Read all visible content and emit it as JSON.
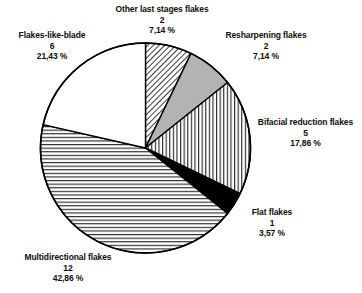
{
  "chart_data": {
    "type": "pie",
    "title": "",
    "subtitle": "",
    "xlabel": "",
    "ylabel": "",
    "legend_position": "none",
    "grid": false,
    "total_count": 28,
    "start_angle_deg": 0,
    "direction": "clockwise",
    "categories": [
      "Other last stages flakes",
      "Resharpening flakes",
      "Bifacial reduction flakes",
      "Flat flakes",
      "Multidirectional flakes",
      "Flakes-like-blade"
    ],
    "values": [
      2,
      2,
      5,
      1,
      12,
      6
    ],
    "percent_labels": [
      "7,14 %",
      "7,14 %",
      "17,86 %",
      "3,57 %",
      "42,86 %",
      "21,43 %"
    ],
    "percents": [
      7.14,
      7.14,
      17.86,
      3.57,
      42.86,
      21.43
    ],
    "slices": [
      {
        "name": "Other last stages flakes",
        "count": "2",
        "percent": "7,14 %",
        "percent_value": 7.14,
        "fill": "diagonal-hatch",
        "fill_color": "#ffffff",
        "line_color": "#000000"
      },
      {
        "name": "Resharpening flakes",
        "count": "2",
        "percent": "7,14 %",
        "percent_value": 7.14,
        "fill": "solid-gray",
        "fill_color": "#b3b3b3",
        "line_color": "#000000"
      },
      {
        "name": "Bifacial reduction flakes",
        "count": "5",
        "percent": "17,86 %",
        "percent_value": 17.86,
        "fill": "vertical-hatch",
        "fill_color": "#ffffff",
        "line_color": "#000000"
      },
      {
        "name": "Flat flakes",
        "count": "1",
        "percent": "3,57 %",
        "percent_value": 3.57,
        "fill": "solid-black",
        "fill_color": "#000000",
        "line_color": "#000000"
      },
      {
        "name": "Multidirectional flakes",
        "count": "12",
        "percent": "42,86 %",
        "percent_value": 42.86,
        "fill": "horizontal-hatch",
        "fill_color": "#ffffff",
        "line_color": "#000000"
      },
      {
        "name": "Flakes-like-blade",
        "count": "6",
        "percent": "21,43 %",
        "percent_value": 21.43,
        "fill": "white",
        "fill_color": "#ffffff",
        "line_color": "#000000"
      }
    ]
  },
  "labels": {
    "other": {
      "name": "Other last stages flakes",
      "count": "2",
      "percent": "7,14 %"
    },
    "resharpening": {
      "name": "Resharpening flakes",
      "count": "2",
      "percent": "7,14 %"
    },
    "bifacial": {
      "name": "Bifacial reduction flakes",
      "count": "5",
      "percent": "17,86 %"
    },
    "flat": {
      "name": "Flat flakes",
      "count": "1",
      "percent": "3,57 %"
    },
    "multidirectional": {
      "name": "Multidirectional flakes",
      "count": "12",
      "percent": "42,86 %"
    },
    "blade": {
      "name": "Flakes-like-blade",
      "count": "6",
      "percent": "21,43 %"
    }
  },
  "colors": {
    "outline": "#000000",
    "gray_fill": "#b3b3b3",
    "black_fill": "#000000",
    "white_fill": "#ffffff",
    "background": "#ffffff",
    "text": "#0d0d0d"
  }
}
